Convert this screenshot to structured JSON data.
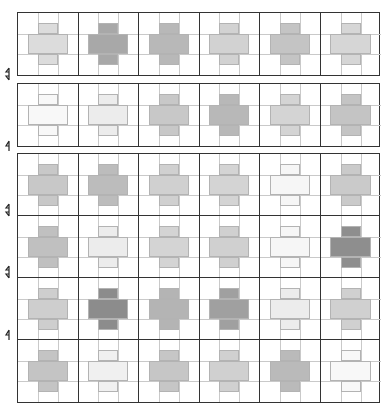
{
  "diagram": {
    "columns": 6,
    "rows": 6,
    "blocks": [
      {
        "name": "block-1",
        "rows": [
          0
        ],
        "top": 12
      },
      {
        "name": "block-2",
        "rows": [
          1
        ],
        "top": 83
      },
      {
        "name": "block-3",
        "rows": [
          2,
          3,
          4,
          5
        ],
        "top": 153
      }
    ],
    "row_separator_arrows": [
      {
        "y": 74,
        "type": "double"
      },
      {
        "y": 145,
        "type": "single"
      },
      {
        "y": 210,
        "type": "double"
      },
      {
        "y": 272,
        "type": "double"
      },
      {
        "y": 334,
        "type": "single"
      }
    ],
    "shades": [
      [
        "#dcdcdc",
        "#a8a8a8",
        "#b8b8b8",
        "#d2d2d2",
        "#c4c4c4",
        "#d6d6d6"
      ],
      [
        "#f8f8f8",
        "#ececec",
        "#c8c8c8",
        "#b8b8b8",
        "#d4d4d4",
        "#c4c4c4"
      ],
      [
        "#c8c8c8",
        "#bcbcbc",
        "#d0d0d0",
        "#d4d4d4",
        "#f6f6f6",
        "#cacaca"
      ],
      [
        "#c0c0c0",
        "#ececec",
        "#d4d4d4",
        "#d0d0d0",
        "#f6f6f6",
        "#8e8e8e"
      ],
      [
        "#cecece",
        "#8c8c8c",
        "#b4b4b4",
        "#a0a0a0",
        "#ececec",
        "#d0d0d0"
      ],
      [
        "#c4c4c4",
        "#f0f0f0",
        "#c6c6c6",
        "#d0d0d0",
        "#bababa",
        "#f8f8f8"
      ]
    ],
    "colors": {
      "border": "#333333",
      "guide": "#c9c9c9",
      "background": "#ffffff"
    }
  }
}
